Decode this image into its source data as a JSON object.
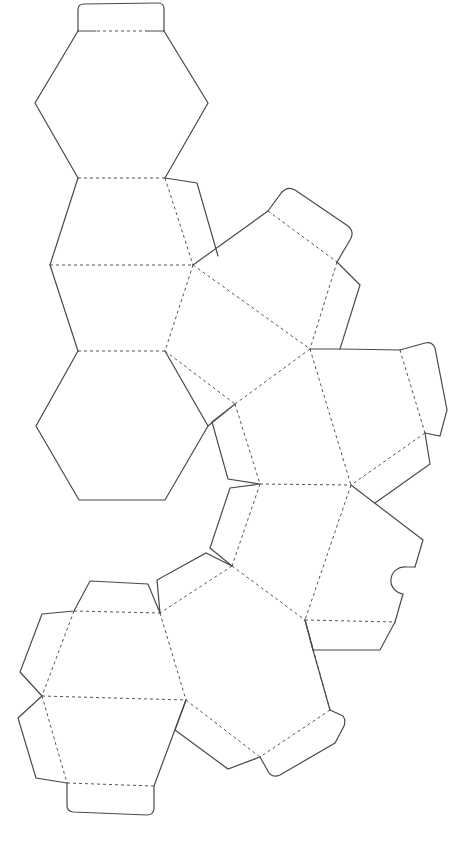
{
  "diagram": {
    "type": "polyhedron-net",
    "background_color": "#ffffff",
    "cut_line_color": "#4a4a4a",
    "fold_line_color": "#555555",
    "legend": {
      "cut": "solid line = cut",
      "fold": "dashed line = fold"
    },
    "faces": [
      {
        "id": "hex-top",
        "shape": "hexagon"
      },
      {
        "id": "trap-upper",
        "shape": "trapezoid"
      },
      {
        "id": "trap-lower",
        "shape": "trapezoid"
      },
      {
        "id": "hex-middle",
        "shape": "hexagon"
      },
      {
        "id": "pent-1",
        "shape": "pentagon"
      },
      {
        "id": "pent-2",
        "shape": "pentagon"
      },
      {
        "id": "pent-3",
        "shape": "pentagon"
      },
      {
        "id": "pent-4",
        "shape": "pentagon"
      },
      {
        "id": "pent-5",
        "shape": "pentagon"
      },
      {
        "id": "pent-6",
        "shape": "pentagon"
      },
      {
        "id": "hex-bottom-upper",
        "shape": "trapezoid"
      },
      {
        "id": "hex-bottom-lower",
        "shape": "trapezoid"
      }
    ],
    "tabs": [
      {
        "id": "tab-top",
        "style": "rounded"
      },
      {
        "id": "tab-right-upper",
        "style": "rounded"
      },
      {
        "id": "tab-right-middle",
        "style": "rounded"
      },
      {
        "id": "tab-bottom-right",
        "style": "rounded"
      },
      {
        "id": "tab-bottom",
        "style": "rounded"
      },
      {
        "id": "notch",
        "style": "semicircle-notch"
      }
    ]
  }
}
